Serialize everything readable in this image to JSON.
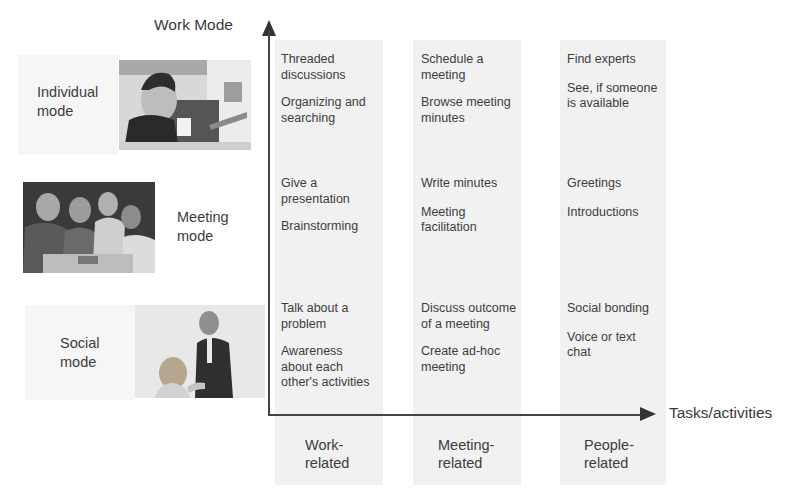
{
  "axes": {
    "y_title": "Work Mode",
    "x_title": "Tasks/activities"
  },
  "rows": [
    {
      "label": "Individual\nmode",
      "image": "person-thinking-photo"
    },
    {
      "label": "Meeting\nmode",
      "image": "group-meeting-photo"
    },
    {
      "label": "Social\nmode",
      "image": "handshake-greeting-photo"
    }
  ],
  "columns": [
    {
      "label": "Work-\nrelated"
    },
    {
      "label": "Meeting-\nrelated"
    },
    {
      "label": "People-\nrelated"
    }
  ],
  "cells": {
    "individual": {
      "work": [
        "Threaded\ndiscussions",
        "Organizing and\nsearching"
      ],
      "meeting": [
        "Schedule a\nmeeting",
        "Browse meeting\nminutes"
      ],
      "people": [
        "Find experts",
        "See, if someone\nis available"
      ]
    },
    "meeting": {
      "work": [
        "Give a\npresentation",
        "Brainstorming"
      ],
      "meeting": [
        "Write minutes",
        "Meeting\nfacilitation"
      ],
      "people": [
        "Greetings",
        "Introductions"
      ]
    },
    "social": {
      "work": [
        "Talk about a\nproblem",
        "Awareness\nabout each\nother's activities"
      ],
      "meeting": [
        "Discuss outcome\nof a meeting",
        "Create ad-hoc\nmeeting"
      ],
      "people": [
        "Social bonding",
        "Voice or text\nchat"
      ]
    }
  },
  "colors": {
    "axis": "#444444",
    "text": "#3c3c3c",
    "band": "#efefef"
  }
}
